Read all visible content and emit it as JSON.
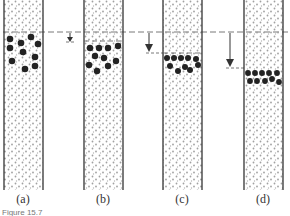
{
  "figure": {
    "caption": "Figure 15.7",
    "panels": [
      {
        "label": "(a)",
        "description": "Particles dispersed just below initial level"
      },
      {
        "label": "(b)",
        "description": "Particles settled slightly, small drop"
      },
      {
        "label": "(c)",
        "description": "Particles packed lower, larger drop"
      },
      {
        "label": "(d)",
        "description": "Particles compacted in layer, largest drop"
      }
    ],
    "reference_line": "dashed initial level",
    "colors": {
      "tube": "#333333",
      "particle": "#222222",
      "medium_dots": "#9a9a9a"
    }
  }
}
